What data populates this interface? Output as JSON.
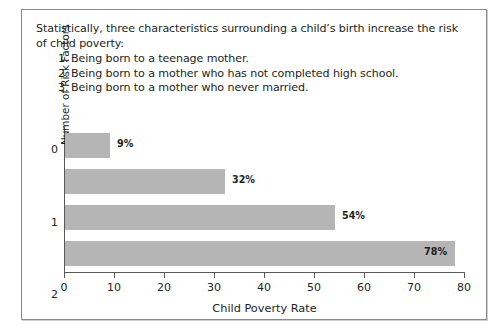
{
  "intro": {
    "paragraph_line1": "Statistically, three characteristics surrounding a child’s birth increase the risk",
    "paragraph_line2": "of child poverty:",
    "items": [
      {
        "number": "1.",
        "text": "Being born to a teenage mother."
      },
      {
        "number": "2.",
        "text": "Being born to a mother who has not completed high school."
      },
      {
        "number": "3.",
        "text": "Being born to a mother who never married."
      }
    ]
  },
  "chart_data": {
    "type": "bar",
    "orientation": "horizontal",
    "title": "",
    "xlabel": "Child Poverty Rate",
    "ylabel": "Number of Risk Factors",
    "categories": [
      "0",
      "1",
      "2",
      "3"
    ],
    "values": [
      9,
      32,
      54,
      78
    ],
    "data_labels": [
      "9%",
      "32%",
      "54%",
      "78%"
    ],
    "label_placement": [
      "outside",
      "outside",
      "outside",
      "inside"
    ],
    "xlim": [
      0,
      80
    ],
    "xticks": [
      0,
      10,
      20,
      30,
      40,
      50,
      60,
      70,
      80
    ],
    "xtick_labels": [
      "0",
      "10",
      "20",
      "30",
      "40",
      "50",
      "60",
      "70",
      "80"
    ],
    "grid": false,
    "legend": false,
    "bar_color": "#b5b5b5",
    "axis_color": "#5a5a5a",
    "text_color": "#231f20"
  }
}
